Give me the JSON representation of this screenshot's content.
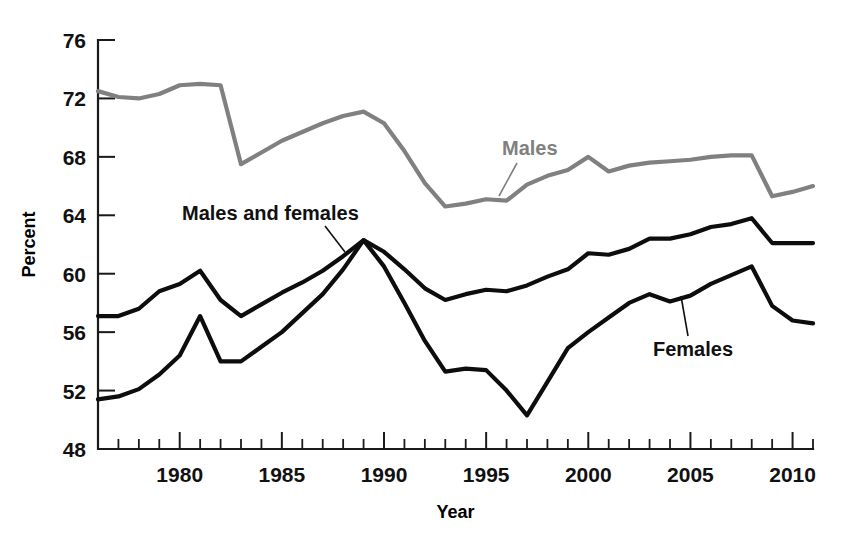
{
  "chart_data": {
    "type": "line",
    "title": "",
    "xlabel": "Year",
    "ylabel": "Percent",
    "xlim": [
      1976,
      2011
    ],
    "ylim": [
      48,
      76
    ],
    "grid": false,
    "legend_position": "inline-annotations",
    "x": [
      1976,
      1977,
      1978,
      1979,
      1980,
      1981,
      1982,
      1983,
      1984,
      1985,
      1986,
      1987,
      1988,
      1989,
      1990,
      1991,
      1992,
      1993,
      1994,
      1995,
      1996,
      1997,
      1998,
      1999,
      2000,
      2001,
      2002,
      2003,
      2004,
      2005,
      2006,
      2007,
      2008,
      2009,
      2010,
      2011
    ],
    "xticklabels": [
      "1980",
      "1985",
      "1990",
      "1995",
      "2000",
      "2005",
      "2010"
    ],
    "xtickvalues": [
      1980,
      1985,
      1990,
      1995,
      2000,
      2005,
      2010
    ],
    "yticklabels": [
      "48",
      "52",
      "56",
      "60",
      "64",
      "68",
      "72",
      "76"
    ],
    "ytickvalues": [
      48,
      52,
      56,
      60,
      64,
      68,
      72,
      76
    ],
    "series": [
      {
        "name": "Males",
        "color": "#808080",
        "values": [
          72.5,
          72.1,
          72.0,
          72.3,
          72.9,
          73.0,
          72.9,
          67.5,
          68.3,
          69.1,
          69.7,
          70.3,
          70.8,
          71.1,
          70.3,
          68.4,
          66.2,
          64.6,
          64.8,
          65.1,
          65.0,
          66.1,
          66.7,
          67.1,
          68.0,
          67.0,
          67.4,
          67.6,
          67.7,
          67.8,
          68.0,
          68.1,
          68.1,
          65.3,
          65.6,
          66.0
        ]
      },
      {
        "name": "Males and females",
        "color": "#0d0d0d",
        "values": [
          57.1,
          57.1,
          57.6,
          58.8,
          59.3,
          60.2,
          58.2,
          57.1,
          57.9,
          58.7,
          59.4,
          60.2,
          61.2,
          62.3,
          61.5,
          60.3,
          59.0,
          58.2,
          58.6,
          58.9,
          58.8,
          59.2,
          59.8,
          60.3,
          61.4,
          61.3,
          61.7,
          62.4,
          62.4,
          62.7,
          63.2,
          63.4,
          63.8,
          62.1,
          62.1,
          62.1
        ]
      },
      {
        "name": "Females",
        "color": "#0d0d0d",
        "values": [
          51.4,
          51.6,
          52.1,
          53.1,
          54.4,
          57.1,
          54.0,
          54.0,
          55.0,
          56.0,
          57.3,
          58.6,
          60.3,
          62.3,
          60.5,
          58.0,
          55.4,
          53.3,
          53.5,
          53.4,
          52.0,
          50.3,
          52.6,
          54.9,
          56.0,
          57.0,
          58.0,
          58.6,
          58.1,
          58.5,
          59.3,
          59.9,
          60.5,
          57.8,
          56.8,
          56.6
        ]
      }
    ],
    "annotations": [
      {
        "id": "males",
        "text": "Males",
        "color": "#808080",
        "label_x": 502,
        "label_y": 155,
        "leader": {
          "x1": 517,
          "y1": 163,
          "x2": 499,
          "y2": 196
        }
      },
      {
        "id": "males-and-females",
        "text": "Males and females",
        "color": "#111111",
        "label_x": 182,
        "label_y": 220,
        "leader": {
          "x1": 325,
          "y1": 226,
          "x2": 345,
          "y2": 252
        }
      },
      {
        "id": "females",
        "text": "Females",
        "color": "#111111",
        "label_x": 653,
        "label_y": 356,
        "leader": {
          "x1": 688,
          "y1": 336,
          "x2": 681,
          "y2": 296
        }
      }
    ]
  }
}
